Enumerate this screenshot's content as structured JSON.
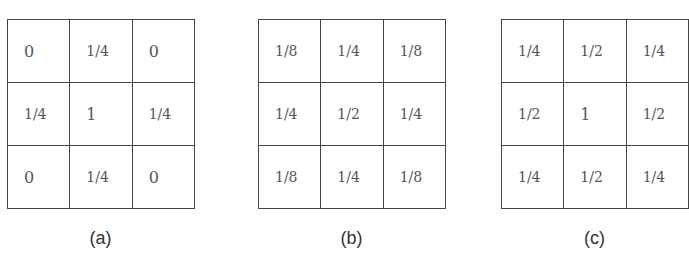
{
  "figure": {
    "kernels": [
      {
        "label": "(a)",
        "cells": [
          [
            "0",
            "1/4",
            "0"
          ],
          [
            "1/4",
            "1",
            "1/4"
          ],
          [
            "0",
            "1/4",
            "0"
          ]
        ]
      },
      {
        "label": "(b)",
        "cells": [
          [
            "1/8",
            "1/4",
            "1/8"
          ],
          [
            "1/4",
            "1/2",
            "1/4"
          ],
          [
            "1/8",
            "1/4",
            "1/8"
          ]
        ]
      },
      {
        "label": "(c)",
        "cells": [
          [
            "1/4",
            "1/2",
            "1/4"
          ],
          [
            "1/2",
            "1",
            "1/2"
          ],
          [
            "1/4",
            "1/2",
            "1/4"
          ]
        ]
      }
    ]
  }
}
